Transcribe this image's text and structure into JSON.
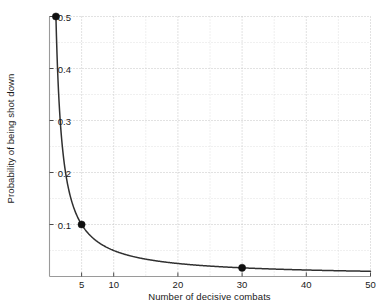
{
  "chart_data": {
    "type": "line",
    "title": "",
    "subtitle": "",
    "xlabel": "Number of decisive combats",
    "ylabel": "Probability of being shot down",
    "xlim": [
      0,
      50
    ],
    "ylim": [
      0,
      0.5
    ],
    "grid": true,
    "grid_style": "dotted",
    "legend": "none",
    "xticks": [
      5,
      10,
      20,
      30,
      40,
      50
    ],
    "xtick_labels": [
      "5",
      "10",
      "20",
      "30",
      "40",
      "50"
    ],
    "yticks": [
      0.1,
      0.2,
      0.3,
      0.4,
      0.5
    ],
    "ytick_labels": [
      "0.1",
      "0.2",
      "0.3",
      "0.4",
      "0.5"
    ],
    "x_minor_gridlines": [
      5,
      10,
      15,
      20,
      25,
      30,
      35,
      40,
      45,
      50
    ],
    "y_minor_gridlines": [
      0.05,
      0.1,
      0.15,
      0.2,
      0.25,
      0.3,
      0.35,
      0.4,
      0.45,
      0.5
    ],
    "series": [
      {
        "name": "Probability of being shot down",
        "relation": "y = 0.5 / x",
        "color": "#303030",
        "x": [
          1,
          1.25,
          1.5,
          1.75,
          2,
          2.5,
          3,
          3.5,
          4,
          4.5,
          5,
          6,
          7,
          8,
          9,
          10,
          12,
          14,
          16,
          18,
          20,
          25,
          30,
          35,
          40,
          45,
          50
        ],
        "y": [
          0.5,
          0.4,
          0.333,
          0.286,
          0.25,
          0.2,
          0.167,
          0.143,
          0.125,
          0.111,
          0.1,
          0.083,
          0.071,
          0.063,
          0.056,
          0.05,
          0.042,
          0.036,
          0.031,
          0.028,
          0.025,
          0.02,
          0.017,
          0.014,
          0.013,
          0.011,
          0.01
        ]
      }
    ],
    "markers": [
      {
        "x": 1,
        "y": 0.5,
        "label": "",
        "color": "#101010"
      },
      {
        "x": 5,
        "y": 0.1,
        "label": "",
        "color": "#101010"
      },
      {
        "x": 30,
        "y": 0.0167,
        "label": "",
        "color": "#101010"
      }
    ],
    "axis_color": "#9a9a9a",
    "grid_color": "#c8c8c8",
    "text_color": "#1a1a1a",
    "background": "#ffffff"
  }
}
